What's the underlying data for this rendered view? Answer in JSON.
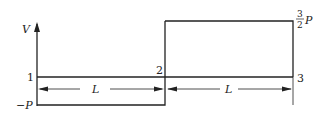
{
  "diagram": {
    "type": "shear-force-diagram",
    "axis_label": "V",
    "points": [
      {
        "id": "1",
        "label": "1"
      },
      {
        "id": "2",
        "label": "2"
      },
      {
        "id": "3",
        "label": "3"
      }
    ],
    "levels": {
      "negative": "−P",
      "positive_num": "3",
      "positive_den": "2",
      "positive_sym": "P"
    },
    "dimensions": [
      {
        "label": "L"
      },
      {
        "label": "L"
      }
    ],
    "colors": {
      "line": "#222222",
      "background": "#ffffff"
    }
  }
}
